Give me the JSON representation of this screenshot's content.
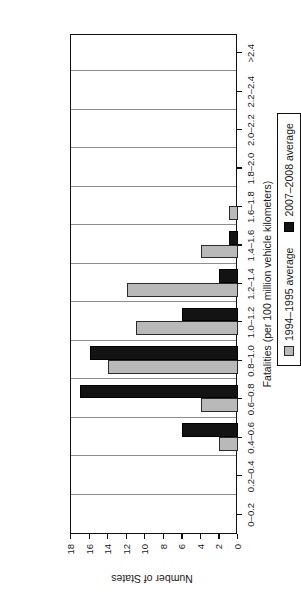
{
  "chart_data": {
    "type": "bar",
    "title": "",
    "xlabel": "Fatalities (per 100 million vehicle kilometers)",
    "ylabel": "Number of States",
    "categories": [
      "0–0.2",
      "0.2–0.4",
      "0.4–0.6",
      "0.6–0.8",
      "0.8–1.0",
      "1.0–1.2",
      "1.2–1.4",
      "1.4–1.6",
      "1.6–1.8",
      "1.8–2.0",
      "2.0–2.2",
      "2.2–2.4",
      ">2.4"
    ],
    "series": [
      {
        "name": "1994–1995 average",
        "color": "#b9b9b9",
        "values": [
          0,
          0,
          2,
          4,
          14,
          11,
          12,
          4,
          1,
          0,
          0,
          0,
          0
        ]
      },
      {
        "name": "2007–2008 average",
        "color": "#131313",
        "values": [
          0,
          0,
          6,
          17,
          16,
          6,
          2,
          1,
          0,
          0,
          0,
          0,
          0
        ]
      }
    ],
    "ylim": [
      0,
      18
    ],
    "yticks": [
      0,
      2,
      4,
      6,
      8,
      10,
      12,
      14,
      16,
      18
    ],
    "ytick_labels": [
      "0",
      "2",
      "4",
      "6",
      "8",
      "10",
      "12",
      "14",
      "16",
      "18"
    ],
    "grid": "vertical-category-separators",
    "legend_position": "below-axis-right",
    "orientation": "rotated-90-clockwise"
  },
  "legend": {
    "entries": [
      {
        "label": "1994–1995 average"
      },
      {
        "label": "2007–2008 average"
      }
    ]
  }
}
